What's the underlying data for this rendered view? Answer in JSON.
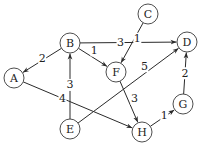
{
  "diagram": {
    "type": "directed-weighted-graph",
    "nodes": [
      {
        "id": "A",
        "label": "A"
      },
      {
        "id": "B",
        "label": "B"
      },
      {
        "id": "C",
        "label": "C"
      },
      {
        "id": "D",
        "label": "D"
      },
      {
        "id": "E",
        "label": "E"
      },
      {
        "id": "F",
        "label": "F"
      },
      {
        "id": "G",
        "label": "G"
      },
      {
        "id": "H",
        "label": "H"
      }
    ],
    "edges": [
      {
        "from": "B",
        "to": "A",
        "weight": "2"
      },
      {
        "from": "B",
        "to": "D",
        "weight": "3"
      },
      {
        "from": "B",
        "to": "F",
        "weight": "1"
      },
      {
        "from": "C",
        "to": "F",
        "weight": "1"
      },
      {
        "from": "E",
        "to": "B",
        "weight": "3"
      },
      {
        "from": "E",
        "to": "D",
        "weight": "5"
      },
      {
        "from": "A",
        "to": "H",
        "weight": "4"
      },
      {
        "from": "F",
        "to": "H",
        "weight": "3"
      },
      {
        "from": "H",
        "to": "G",
        "weight": "1"
      },
      {
        "from": "G",
        "to": "D",
        "weight": "2"
      }
    ]
  }
}
